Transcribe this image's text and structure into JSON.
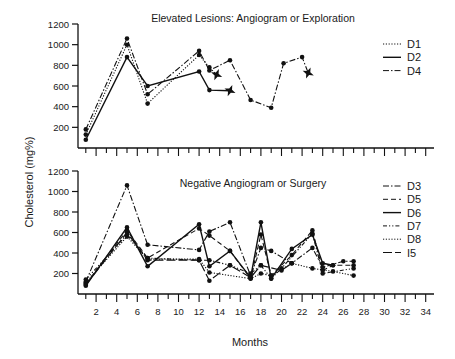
{
  "y_label": "Cholesterol (mg%)",
  "x_label": "Months",
  "chart_data": [
    {
      "type": "line",
      "title": "Elevated Lesions: Angiogram or Exploration",
      "xlabel": "Months",
      "ylabel": "Cholesterol (mg%)",
      "ylim": [
        0,
        1200
      ],
      "xlim": [
        0,
        35
      ],
      "y_ticks": [
        "200",
        "400",
        "600",
        "800",
        "1000",
        "1200"
      ],
      "grid": false,
      "legend_position": "upper right",
      "series": [
        {
          "name": "D1",
          "style": "dotted",
          "x": [
            1,
            5,
            7,
            12,
            13,
            13.7
          ],
          "y": [
            130,
            1000,
            430,
            900,
            780,
            710
          ],
          "end_marker": "star"
        },
        {
          "name": "D2",
          "style": "solid",
          "x": [
            1,
            5,
            7,
            12,
            13,
            15
          ],
          "y": [
            80,
            880,
            600,
            740,
            560,
            555
          ],
          "end_marker": "star"
        },
        {
          "name": "D4",
          "style": "dash-dot",
          "x": [
            1,
            5,
            7,
            12,
            13,
            15,
            17,
            19,
            20.2,
            22,
            22.6
          ],
          "y": [
            180,
            1060,
            520,
            940,
            750,
            850,
            465,
            390,
            820,
            880,
            725
          ],
          "end_marker": "star"
        }
      ]
    },
    {
      "type": "line",
      "title": "Negative Angiogram or Surgery",
      "xlabel": "Months",
      "ylabel": "Cholesterol (mg%)",
      "ylim": [
        0,
        1200
      ],
      "xlim": [
        0,
        35
      ],
      "y_ticks": [
        "200",
        "400",
        "600",
        "800",
        "1000",
        "1200"
      ],
      "x_ticks": [
        "2",
        "4",
        "6",
        "8",
        "10",
        "12",
        "14",
        "16",
        "18",
        "20",
        "22",
        "24",
        "26",
        "28",
        "30",
        "32",
        "34"
      ],
      "grid": false,
      "legend_position": "upper right",
      "series": [
        {
          "name": "D3",
          "style": "dash-dot",
          "x": [
            1,
            5,
            7,
            12,
            13,
            15,
            17,
            18,
            19,
            21,
            23,
            24,
            26,
            27
          ],
          "y": [
            120,
            1060,
            480,
            430,
            610,
            700,
            180,
            450,
            420,
            300,
            450,
            260,
            320,
            320
          ]
        },
        {
          "name": "D5",
          "style": "dashed",
          "x": [
            1,
            5,
            7,
            12,
            13,
            15,
            17,
            18,
            19,
            21,
            23,
            24,
            25,
            27
          ],
          "y": [
            100,
            620,
            350,
            640,
            570,
            420,
            150,
            580,
            180,
            380,
            620,
            230,
            280,
            280
          ]
        },
        {
          "name": "D6",
          "style": "solid",
          "x": [
            1,
            5,
            7,
            12,
            13,
            15,
            17,
            18,
            19,
            21,
            23,
            24,
            25
          ],
          "y": [
            80,
            650,
            270,
            680,
            270,
            420,
            160,
            700,
            150,
            440,
            580,
            300,
            280
          ]
        },
        {
          "name": "D7",
          "style": "dash-dot-dot",
          "x": [
            1,
            5,
            7,
            12,
            13,
            15,
            17,
            18,
            19,
            20,
            23,
            24,
            27
          ],
          "y": [
            140,
            580,
            350,
            330,
            330,
            280,
            200,
            280,
            150,
            250,
            590,
            200,
            250
          ]
        },
        {
          "name": "D8",
          "style": "dotted",
          "x": [
            1,
            5,
            7,
            12,
            13,
            17,
            18,
            19,
            21,
            23,
            25,
            27
          ],
          "y": [
            110,
            560,
            340,
            340,
            210,
            150,
            200,
            180,
            300,
            250,
            220,
            180
          ]
        },
        {
          "name": "I5",
          "style": "long-dash",
          "x": [
            1,
            5,
            7,
            12,
            13,
            15,
            17,
            18,
            20,
            21
          ],
          "y": [
            90,
            600,
            330,
            330,
            130,
            280,
            160,
            280,
            230,
            300
          ]
        }
      ]
    }
  ]
}
